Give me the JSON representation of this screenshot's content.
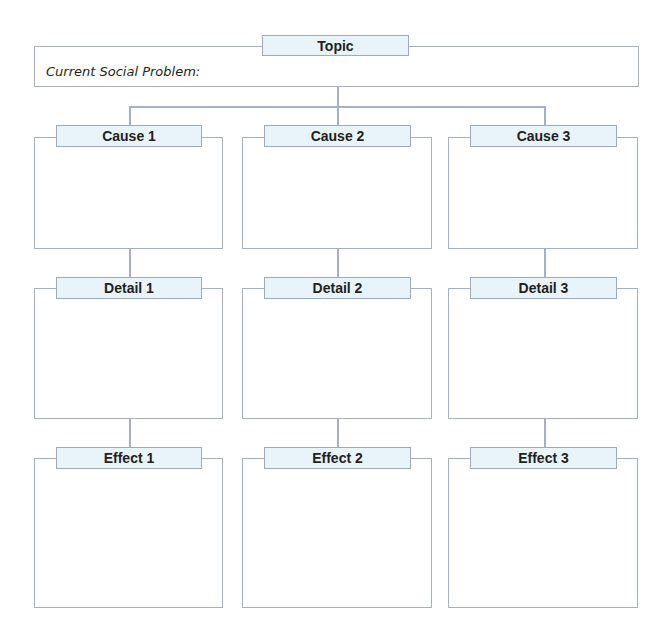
{
  "topic": {
    "label": "Topic",
    "prompt": "Current Social Problem:"
  },
  "columns": [
    {
      "cause": "Cause 1",
      "detail": "Detail 1",
      "effect": "Effect 1"
    },
    {
      "cause": "Cause 2",
      "detail": "Detail 2",
      "effect": "Effect 2"
    },
    {
      "cause": "Cause 3",
      "detail": "Detail 3",
      "effect": "Effect 3"
    }
  ],
  "colors": {
    "border": "#a3b1c2",
    "label_bg": "#e8f4fa"
  }
}
